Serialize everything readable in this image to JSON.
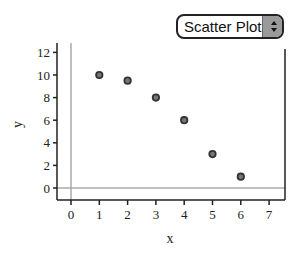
{
  "plot_type_select": {
    "value": "Scatter Plot"
  },
  "chart_data": {
    "type": "scatter",
    "title": "",
    "xlabel": "x",
    "ylabel": "y",
    "x": [
      1,
      2,
      3,
      4,
      5,
      6
    ],
    "y": [
      10,
      9.5,
      8,
      6,
      3,
      1
    ],
    "xlim": [
      -0.5,
      7.5
    ],
    "ylim": [
      -1,
      12.8
    ],
    "xticks": [
      0,
      1,
      2,
      3,
      4,
      5,
      6,
      7
    ],
    "yticks": [
      0,
      2,
      4,
      6,
      8,
      10,
      12
    ],
    "grid": false,
    "zero_lines": true,
    "colors": {
      "marker": "#333333",
      "axis": "#222222",
      "zero_line": "#aaaaaa"
    }
  }
}
